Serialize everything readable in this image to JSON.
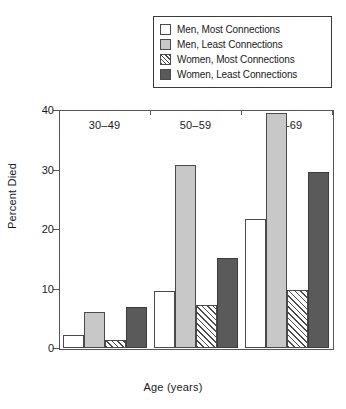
{
  "chart_data": {
    "type": "bar",
    "title": "",
    "xlabel": "Age (years)",
    "ylabel": "Percent Died",
    "categories": [
      "30–49",
      "50–59",
      "60–69"
    ],
    "ylim": [
      0,
      40
    ],
    "yticks": [
      0,
      10,
      20,
      30,
      40
    ],
    "ytick_labels": [
      "0",
      "10",
      "20",
      "30",
      "40"
    ],
    "grid": false,
    "legend_position": "top-right",
    "series": [
      {
        "name": "Men, Most Connections",
        "swatch": "white",
        "color": "#ffffff",
        "values": [
          2.2,
          9.5,
          21.7
        ]
      },
      {
        "name": "Men, Least Connections",
        "swatch": "light-gray",
        "color": "#c8c8c8",
        "values": [
          6.0,
          30.7,
          39.5
        ]
      },
      {
        "name": "Women, Most Connections",
        "swatch": "diagonal-hatch",
        "color": "#ffffff",
        "values": [
          1.4,
          7.2,
          9.8
        ]
      },
      {
        "name": "Women, Least Connections",
        "swatch": "dark-gray",
        "color": "#5a5a5a",
        "values": [
          6.9,
          15.2,
          29.5
        ]
      }
    ]
  },
  "legend": {
    "items": [
      {
        "label": "Men, Most Connections"
      },
      {
        "label": "Men, Least Connections"
      },
      {
        "label": "Women, Most Connections"
      },
      {
        "label": "Women, Least Connections"
      }
    ]
  },
  "axes": {
    "y_title": "Percent Died",
    "x_title": "Age (years)",
    "y_tick_labels": [
      "0",
      "10",
      "20",
      "30",
      "40"
    ],
    "x_tick_labels": [
      "30–49",
      "50–59",
      "60–69"
    ]
  },
  "colors": {
    "axis": "#555555",
    "outline": "#4a4a4a",
    "light_gray": "#c8c8c8",
    "dark_gray": "#5a5a5a",
    "white": "#ffffff"
  }
}
